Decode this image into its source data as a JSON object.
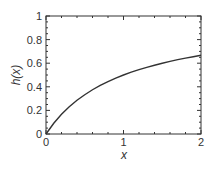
{
  "chart_data": {
    "type": "line",
    "title": "",
    "xlabel": "x",
    "ylabel": "h(x)",
    "xlim": [
      0,
      2
    ],
    "ylim": [
      0,
      1
    ],
    "x_ticks": [
      0,
      1,
      2
    ],
    "x_tick_labels": [
      "0",
      "1",
      "2"
    ],
    "x_minor_step": 0.2,
    "y_ticks": [
      0,
      0.2,
      0.4,
      0.6,
      0.8,
      1
    ],
    "y_tick_labels": [
      "0",
      "0.2",
      "0.4",
      "0.6",
      "0.8",
      "1"
    ],
    "y_minor_step": 0.05,
    "grid": false,
    "legend": "none",
    "series": [
      {
        "name": "h(x)",
        "color": "#333333",
        "x": [
          0,
          0.1,
          0.2,
          0.3,
          0.4,
          0.5,
          0.6,
          0.7,
          0.8,
          0.9,
          1.0,
          1.1,
          1.2,
          1.3,
          1.4,
          1.5,
          1.6,
          1.7,
          1.8,
          1.9,
          2.0
        ],
        "y": [
          0,
          0.091,
          0.167,
          0.231,
          0.286,
          0.333,
          0.375,
          0.412,
          0.444,
          0.474,
          0.5,
          0.524,
          0.545,
          0.565,
          0.583,
          0.6,
          0.615,
          0.63,
          0.643,
          0.655,
          0.667
        ]
      }
    ]
  }
}
